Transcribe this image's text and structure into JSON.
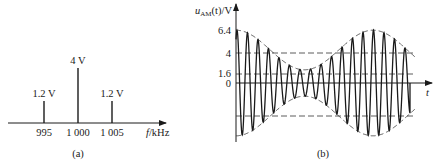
{
  "panel_a": {
    "caption": "(a)",
    "x_axis_label_var": "f",
    "x_axis_label_unit": "/kHz",
    "spectral_lines": [
      {
        "freq_label": "995",
        "amp_label": "1.2 V",
        "amplitude": 1.2
      },
      {
        "freq_label": "1 000",
        "amp_label": "4 V",
        "amplitude": 4
      },
      {
        "freq_label": "1 005",
        "amp_label": "1.2 V",
        "amplitude": 1.2
      }
    ]
  },
  "panel_b": {
    "caption": "(b)",
    "y_axis_label_var": "u",
    "y_axis_label_sub": "AM",
    "y_axis_label_rest": "(t)/V",
    "x_axis_label": "t",
    "y_ticks": [
      "6.4",
      "4",
      "1.6",
      "0"
    ]
  },
  "chart_data": [
    {
      "type": "bar",
      "title": "Amplitude spectrum of AM signal",
      "categories": [
        "995",
        "1 000",
        "1 005"
      ],
      "values": [
        1.2,
        4,
        1.2
      ],
      "value_labels": [
        "1.2 V",
        "4 V",
        "1.2 V"
      ],
      "xlabel": "f/kHz",
      "ylabel": "",
      "caption": "(a)"
    },
    {
      "type": "line",
      "title": "AM waveform",
      "xlabel": "t",
      "ylabel": "u_AM(t)/V",
      "y_ticks": [
        6.4,
        4,
        1.6,
        0
      ],
      "dashed_reference_lines": [
        4,
        1.6,
        -4
      ],
      "envelope": {
        "carrier_amplitude": 4,
        "max": 6.4,
        "min": 1.6,
        "modulation_index": 0.6
      },
      "ylim": [
        -6.4,
        6.4
      ],
      "caption": "(b)"
    }
  ]
}
